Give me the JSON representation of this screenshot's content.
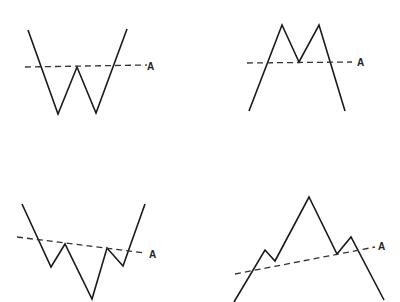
{
  "diagram": {
    "colors": {
      "line": "#1a1a1a",
      "dashed": "#333333",
      "background": "#ffffff"
    },
    "panels": [
      {
        "name": "double-bottom",
        "label": "A",
        "price_points": "28,30 58,114 77,67 96,113 127,29",
        "neckline": {
          "x1": 25,
          "y1": 67,
          "x2": 147,
          "y2": 65
        },
        "label_pos": {
          "x": 147,
          "y": 70
        }
      },
      {
        "name": "double-top",
        "label": "A",
        "price_points": "249,111 282,25 299,62 319,25 345,111",
        "neckline": {
          "x1": 247,
          "y1": 63,
          "x2": 352,
          "y2": 62
        },
        "label_pos": {
          "x": 357,
          "y": 66
        }
      },
      {
        "name": "inverse-head-and-shoulders",
        "label": "A",
        "price_points": "22,204 51,267 65,244 92,299 107,248 123,266 145,204",
        "neckline": {
          "x1": 17,
          "y1": 237,
          "x2": 145,
          "y2": 253
        },
        "label_pos": {
          "x": 149,
          "y": 258
        }
      },
      {
        "name": "head-and-shoulders",
        "label": "A",
        "price_points": "234,302 265,250 275,261 309,197 337,254 351,237 384,300",
        "neckline": {
          "x1": 235,
          "y1": 274,
          "x2": 375,
          "y2": 247
        },
        "label_pos": {
          "x": 378,
          "y": 250
        }
      }
    ]
  }
}
